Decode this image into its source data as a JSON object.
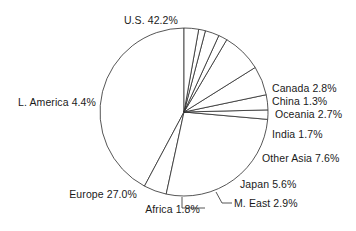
{
  "chart_data": {
    "type": "pie",
    "title": "",
    "subtitle": "",
    "xlabel": "",
    "ylabel": "",
    "legend_position": "none",
    "grid": false,
    "units": "percent",
    "start_angle_deg": 90,
    "direction": "counterclockwise",
    "categories": [
      "U.S.",
      "L. America",
      "Europe",
      "Africa",
      "M. East",
      "Japan",
      "Other Asia",
      "India",
      "Oceania",
      "China",
      "Canada"
    ],
    "values": [
      42.2,
      4.4,
      27.0,
      1.8,
      2.9,
      5.6,
      7.6,
      1.7,
      2.7,
      1.3,
      2.8
    ],
    "slices": [
      {
        "label": "U.S. 42.2%",
        "name": "U.S.",
        "value": 42.2
      },
      {
        "label": "L. America 4.4%",
        "name": "L. America",
        "value": 4.4
      },
      {
        "label": "Europe 27.0%",
        "name": "Europe",
        "value": 27.0
      },
      {
        "label": "Africa 1.8%",
        "name": "Africa",
        "value": 1.8
      },
      {
        "label": "M. East 2.9%",
        "name": "M. East",
        "value": 2.9
      },
      {
        "label": "Japan 5.6%",
        "name": "Japan",
        "value": 5.6
      },
      {
        "label": "Other Asia 7.6%",
        "name": "Other Asia",
        "value": 7.6
      },
      {
        "label": "India 1.7%",
        "name": "India",
        "value": 1.7
      },
      {
        "label": "Oceania 2.7%",
        "name": "Oceania",
        "value": 2.7
      },
      {
        "label": "China 1.3%",
        "name": "China",
        "value": 1.3
      },
      {
        "label": "Canada 2.8%",
        "name": "Canada",
        "value": 2.8
      }
    ],
    "colors": {
      "slice_fill": "#ffffff",
      "slice_stroke": "#2b2b2b",
      "background": "#ffffff",
      "text": "#1a1a1a"
    }
  },
  "labels": {
    "us": "U.S. 42.2%",
    "l_america": "L. America 4.4%",
    "europe": "Europe 27.0%",
    "africa": "Africa 1.8%",
    "m_east": "M. East 2.9%",
    "japan": "Japan 5.6%",
    "other_asia": "Other Asia 7.6%",
    "india": "India 1.7%",
    "oceania": "Oceania 2.7%",
    "china": "China 1.3%",
    "canada": "Canada 2.8%"
  }
}
